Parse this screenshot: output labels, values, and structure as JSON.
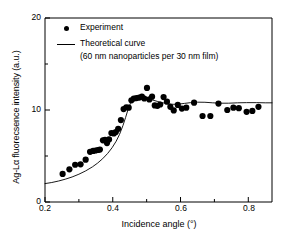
{
  "chart_data": {
    "type": "scatter",
    "title": "",
    "xlabel": "Incidence angle (°)",
    "ylabel": "Ag-Lα fluorecsence intensity (a.u.)",
    "xlim": [
      0.2,
      0.87
    ],
    "ylim": [
      0,
      20
    ],
    "xticks": [
      0.2,
      0.4,
      0.6,
      0.8
    ],
    "xtick_labels": [
      "0.2",
      "0.4",
      "0.6",
      "0.8"
    ],
    "xminor_ticks": [
      0.3,
      0.5,
      0.7
    ],
    "yticks": [
      0,
      10,
      20
    ],
    "ytick_labels": [
      "0",
      "10",
      "20"
    ],
    "yminor_ticks": [
      5,
      15
    ],
    "grid": false,
    "legend_position": "top-left",
    "marker_color": "#000000",
    "line_color": "#000000",
    "series": [
      {
        "name": "Experiment",
        "type": "scatter",
        "marker": "filled-circle",
        "points": [
          [
            0.252,
            3.05
          ],
          [
            0.272,
            3.55
          ],
          [
            0.289,
            4.05
          ],
          [
            0.305,
            4.1
          ],
          [
            0.32,
            4.6
          ],
          [
            0.333,
            5.45
          ],
          [
            0.342,
            5.55
          ],
          [
            0.349,
            5.6
          ],
          [
            0.356,
            5.65
          ],
          [
            0.362,
            5.7
          ],
          [
            0.371,
            6.7
          ],
          [
            0.377,
            6.75
          ],
          [
            0.383,
            6.4
          ],
          [
            0.389,
            6.8
          ],
          [
            0.396,
            7.5
          ],
          [
            0.403,
            7.45
          ],
          [
            0.409,
            7.6
          ],
          [
            0.416,
            7.95
          ],
          [
            0.424,
            8.9
          ],
          [
            0.432,
            10.1
          ],
          [
            0.44,
            10.3
          ],
          [
            0.447,
            10.25
          ],
          [
            0.455,
            11.05
          ],
          [
            0.462,
            11.25
          ],
          [
            0.47,
            11.3
          ],
          [
            0.478,
            11.35
          ],
          [
            0.486,
            11.45
          ],
          [
            0.493,
            11.25
          ],
          [
            0.501,
            12.4
          ],
          [
            0.508,
            11.15
          ],
          [
            0.516,
            11.45
          ],
          [
            0.524,
            10.5
          ],
          [
            0.532,
            10.45
          ],
          [
            0.54,
            10.6
          ],
          [
            0.55,
            11.4
          ],
          [
            0.56,
            10.9
          ],
          [
            0.57,
            10.35
          ],
          [
            0.58,
            9.95
          ],
          [
            0.592,
            10.55
          ],
          [
            0.604,
            10.15
          ],
          [
            0.617,
            10.25
          ],
          [
            0.64,
            10.8
          ],
          [
            0.665,
            9.35
          ],
          [
            0.688,
            9.35
          ],
          [
            0.712,
            10.7
          ],
          [
            0.738,
            10.0
          ],
          [
            0.756,
            10.25
          ],
          [
            0.772,
            10.2
          ],
          [
            0.795,
            9.8
          ],
          [
            0.812,
            9.9
          ],
          [
            0.83,
            10.35
          ]
        ]
      },
      {
        "name": "Theoretical curve",
        "type": "line",
        "annotation": "(60 nm nanoparticles per 30 nm film)",
        "points": [
          [
            0.2,
            2.0
          ],
          [
            0.22,
            2.12
          ],
          [
            0.24,
            2.28
          ],
          [
            0.26,
            2.48
          ],
          [
            0.28,
            2.72
          ],
          [
            0.3,
            3.02
          ],
          [
            0.32,
            3.38
          ],
          [
            0.34,
            3.82
          ],
          [
            0.355,
            4.22
          ],
          [
            0.37,
            4.7
          ],
          [
            0.385,
            5.28
          ],
          [
            0.398,
            5.9
          ],
          [
            0.41,
            6.6
          ],
          [
            0.42,
            7.35
          ],
          [
            0.43,
            8.3
          ],
          [
            0.438,
            9.2
          ],
          [
            0.445,
            10.05
          ],
          [
            0.452,
            10.7
          ],
          [
            0.46,
            11.1
          ],
          [
            0.468,
            11.28
          ],
          [
            0.478,
            11.32
          ],
          [
            0.49,
            11.28
          ],
          [
            0.503,
            11.2
          ],
          [
            0.518,
            11.08
          ],
          [
            0.533,
            10.92
          ],
          [
            0.548,
            10.78
          ],
          [
            0.562,
            10.68
          ],
          [
            0.578,
            10.62
          ],
          [
            0.595,
            10.64
          ],
          [
            0.612,
            10.72
          ],
          [
            0.63,
            10.8
          ],
          [
            0.65,
            10.85
          ],
          [
            0.672,
            10.84
          ],
          [
            0.695,
            10.78
          ],
          [
            0.718,
            10.74
          ],
          [
            0.742,
            10.74
          ],
          [
            0.768,
            10.78
          ],
          [
            0.795,
            10.8
          ],
          [
            0.825,
            10.8
          ],
          [
            0.85,
            10.78
          ],
          [
            0.87,
            10.78
          ]
        ]
      }
    ]
  },
  "legend": {
    "experiment_label": "Experiment",
    "theory_label": "Theoretical curve",
    "theory_sublabel": "(60 nm nanoparticles per 30 nm film)"
  },
  "axes": {
    "x_axis_label": "Incidence angle (°)",
    "y_axis_label": "Ag-Lα fluorecsence intensity (a.u.)",
    "x_tick_0": "0.2",
    "x_tick_1": "0.4",
    "x_tick_2": "0.6",
    "x_tick_3": "0.8",
    "y_tick_0": "0",
    "y_tick_1": "10",
    "y_tick_2": "20"
  }
}
